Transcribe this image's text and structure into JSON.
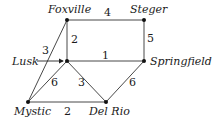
{
  "graph": {
    "nodes": [
      {
        "id": "foxville",
        "label": "Foxville",
        "x": 67,
        "y": 20,
        "lx": 48,
        "ly": 13,
        "anchor": "start"
      },
      {
        "id": "steger",
        "label": "Steger",
        "x": 144,
        "y": 20,
        "lx": 130,
        "ly": 13,
        "anchor": "start"
      },
      {
        "id": "lusk",
        "label": "Lusk",
        "x": 67,
        "y": 61,
        "lx": 12,
        "ly": 65,
        "anchor": "start"
      },
      {
        "id": "springfield",
        "label": "Springfield",
        "x": 144,
        "y": 61,
        "lx": 150,
        "ly": 65,
        "anchor": "start"
      },
      {
        "id": "mystic",
        "label": "Mystic",
        "x": 28,
        "y": 102,
        "lx": 14,
        "ly": 115,
        "anchor": "start"
      },
      {
        "id": "delrio",
        "label": "Del Rio",
        "x": 106,
        "y": 102,
        "lx": 89,
        "ly": 115,
        "anchor": "start"
      }
    ],
    "edges": [
      {
        "from": "foxville",
        "to": "steger",
        "weight": "4",
        "lx": 104,
        "ly": 16
      },
      {
        "from": "foxville",
        "to": "lusk",
        "weight": "2",
        "lx": 71,
        "ly": 43
      },
      {
        "from": "foxville",
        "to": "mystic",
        "weight": "3",
        "lx": 42,
        "ly": 54
      },
      {
        "from": "lusk",
        "to": "springfield",
        "weight": "1",
        "lx": 102,
        "ly": 59
      },
      {
        "from": "steger",
        "to": "springfield",
        "weight": "5",
        "lx": 147,
        "ly": 42
      },
      {
        "from": "lusk",
        "to": "mystic",
        "weight": "6",
        "lx": 51,
        "ly": 86
      },
      {
        "from": "lusk",
        "to": "delrio",
        "weight": "3",
        "lx": 78,
        "ly": 86
      },
      {
        "from": "mystic",
        "to": "delrio",
        "weight": "2",
        "lx": 64,
        "ly": 115
      },
      {
        "from": "delrio",
        "to": "springfield",
        "weight": "6",
        "lx": 129,
        "ly": 86
      }
    ],
    "lusk_arrow": {
      "x1": 37,
      "y1": 61,
      "x2": 63,
      "y2": 61
    }
  }
}
